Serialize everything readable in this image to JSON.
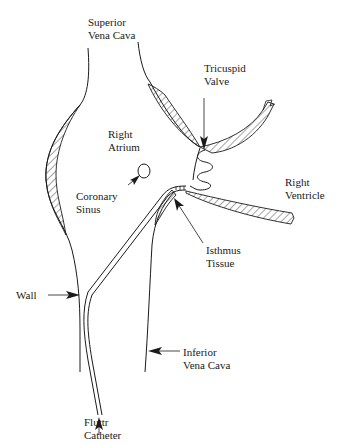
{
  "diagram": {
    "labels": {
      "superior_vena_cava": "Superior\nVena Cava",
      "tricuspid_valve": "Tricuspid\nValve",
      "right_atrium": "Right\nAtrium",
      "coronary_sinus": "Coronary\nSinus",
      "right_ventricle": "Right\nVentricle",
      "isthmus_tissue": "Isthmus\nTissue",
      "wall": "Wall",
      "inferior_vena_cava": "Inferior\nVena Cava",
      "fluttr_catheter": "Fluttr\nCatheter"
    },
    "colors": {
      "line": "#1a1a1a",
      "background": "#ffffff"
    }
  }
}
